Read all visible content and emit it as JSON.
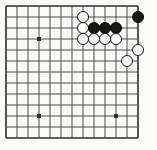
{
  "figure": {
    "title": "Go board corner diagram",
    "board_label": "go-board",
    "width": 157,
    "height": 150,
    "background_color": "#fbfbfa",
    "line_color": "#4a4a4a",
    "edge_line_color": "#2e2e2e",
    "black_stone_color": "#1a1715",
    "white_stone_color": "#fdfdfd",
    "white_stone_border_color": "#151515"
  },
  "board": {
    "visible_columns": 13,
    "visible_rows": 13,
    "cell_size": 11.0,
    "origin_x": 6.0,
    "origin_y": 6.0,
    "stone_diameter": 12.4,
    "line_width": 1.0,
    "edge_line_width": 1.6,
    "star_point_radius": 2.0
  },
  "star_points": [
    {
      "name": "star-point-upper-left",
      "col": 3,
      "row": 3
    },
    {
      "name": "star-point-lower-left",
      "col": 3,
      "row": 10
    },
    {
      "name": "star-point-lower-right",
      "col": 10,
      "row": 10
    }
  ],
  "stones": [
    {
      "name": "white-stone-c7-r1",
      "color": "white",
      "col": 7,
      "row": 1
    },
    {
      "name": "white-stone-c7-r2",
      "color": "white",
      "col": 7,
      "row": 2
    },
    {
      "name": "white-stone-c7-r3",
      "color": "white",
      "col": 7,
      "row": 3
    },
    {
      "name": "black-stone-c8-r2",
      "color": "black",
      "col": 8,
      "row": 2
    },
    {
      "name": "black-stone-c9-r2",
      "color": "black",
      "col": 9,
      "row": 2
    },
    {
      "name": "black-stone-c10-r2",
      "color": "black",
      "col": 10,
      "row": 2
    },
    {
      "name": "white-stone-c8-r3",
      "color": "white",
      "col": 8,
      "row": 3
    },
    {
      "name": "white-stone-c9-r3",
      "color": "white",
      "col": 9,
      "row": 3
    },
    {
      "name": "white-stone-c10-r3",
      "color": "white",
      "col": 10,
      "row": 3
    },
    {
      "name": "black-stone-c12-r1",
      "color": "black",
      "col": 12,
      "row": 1
    },
    {
      "name": "white-stone-c12-r4",
      "color": "white",
      "col": 12,
      "row": 4
    },
    {
      "name": "white-stone-c11-r5",
      "color": "white",
      "col": 11,
      "row": 5
    }
  ],
  "counts": {
    "black_stones": 4,
    "white_stones": 8,
    "total_stones": 12
  }
}
